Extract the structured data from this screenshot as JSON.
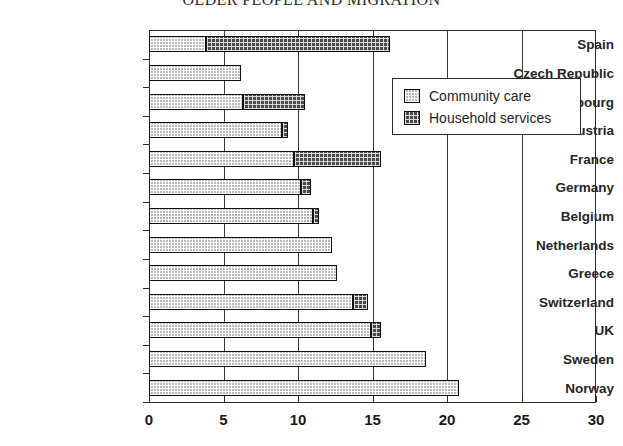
{
  "chart_data": {
    "type": "bar",
    "orientation": "horizontal",
    "stacked": true,
    "title": "OLDER PEOPLE AND MIGRATION",
    "xlabel": "",
    "ylabel": "",
    "xlim": [
      0,
      30
    ],
    "xticks": [
      0,
      5,
      10,
      15,
      20,
      25,
      30
    ],
    "xtick_labels": [
      "0",
      "5",
      "10",
      "15",
      "20",
      "25",
      "30"
    ],
    "grid": true,
    "grid_axis": "x",
    "legend_position": "upper right",
    "categories": [
      "Spain",
      "Czech Republic",
      "Luxembourg",
      "Austria",
      "France",
      "Germany",
      "Belgium",
      "Netherlands",
      "Greece",
      "Switzerland",
      "UK",
      "Sweden",
      "Norway"
    ],
    "series": [
      {
        "name": "Community care",
        "color": "#b9b9b9",
        "values": [
          3.8,
          6.2,
          6.3,
          8.9,
          9.7,
          10.2,
          11.0,
          12.3,
          12.6,
          13.7,
          14.9,
          18.6,
          20.8
        ]
      },
      {
        "name": "Household services",
        "color": "#4a4a4a",
        "values": [
          12.4,
          0.0,
          4.2,
          0.4,
          5.9,
          0.7,
          0.4,
          0.0,
          0.0,
          1.0,
          0.7,
          0.0,
          0.0
        ]
      }
    ],
    "totals": [
      16.2,
      6.2,
      10.5,
      9.3,
      15.6,
      10.9,
      11.4,
      12.3,
      12.6,
      14.7,
      15.6,
      18.6,
      20.8
    ]
  },
  "legend": {
    "items": [
      {
        "label": "Community care",
        "swatch": "light-checker-swatch"
      },
      {
        "label": "Household services",
        "swatch": "dark-speckle-swatch"
      }
    ]
  }
}
